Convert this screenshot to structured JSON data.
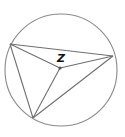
{
  "diagram": {
    "type": "inscribed-triangle-with-center",
    "circle": {
      "cx": 61,
      "cy": 70,
      "r": 56
    },
    "points": {
      "A": {
        "x": 10,
        "y": 44
      },
      "B": {
        "x": 113,
        "y": 56
      },
      "C": {
        "x": 33,
        "y": 118
      },
      "Z": {
        "x": 60,
        "y": 68
      }
    },
    "center_label": "Z",
    "label_position": {
      "x": 57,
      "y": 62
    },
    "segments": [
      [
        "A",
        "B"
      ],
      [
        "A",
        "C"
      ],
      [
        "C",
        "B"
      ],
      [
        "A",
        "Z"
      ],
      [
        "Z",
        "B"
      ],
      [
        "Z",
        "C"
      ]
    ],
    "colors": {
      "circle": "#8a8a8a",
      "lines": "#6f6f6f",
      "label": "#111111"
    }
  }
}
